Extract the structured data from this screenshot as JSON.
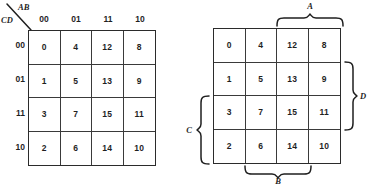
{
  "figure": {
    "background_color": "#ffffff",
    "line_color": "#2b2b2b"
  },
  "left_map": {
    "name": "karnaugh-map-labeled-axes",
    "corner": {
      "top_label": "AB",
      "bottom_label": "CD"
    },
    "column_headers": [
      "00",
      "01",
      "11",
      "10"
    ],
    "row_headers": [
      "00",
      "01",
      "11",
      "10"
    ],
    "cells": [
      [
        "0",
        "4",
        "12",
        "8"
      ],
      [
        "1",
        "5",
        "13",
        "9"
      ],
      [
        "3",
        "7",
        "15",
        "11"
      ],
      [
        "2",
        "6",
        "14",
        "10"
      ]
    ]
  },
  "right_map": {
    "name": "karnaugh-map-variable-regions",
    "cells": [
      [
        "0",
        "4",
        "12",
        "8"
      ],
      [
        "1",
        "5",
        "13",
        "9"
      ],
      [
        "3",
        "7",
        "15",
        "11"
      ],
      [
        "2",
        "6",
        "14",
        "10"
      ]
    ],
    "braces": [
      {
        "label": "A",
        "position": "top",
        "spans": "columns 3-4"
      },
      {
        "label": "B",
        "position": "bottom",
        "spans": "columns 2-3"
      },
      {
        "label": "C",
        "position": "left",
        "spans": "rows 3-4"
      },
      {
        "label": "D",
        "position": "right",
        "spans": "rows 2-3"
      }
    ]
  }
}
